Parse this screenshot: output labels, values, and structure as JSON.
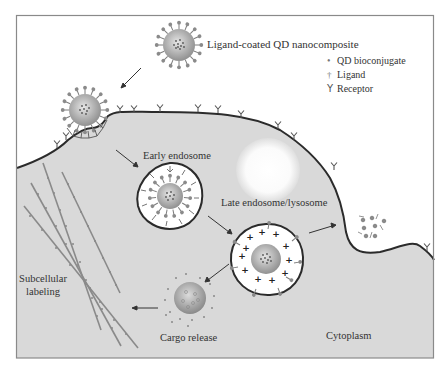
{
  "figure": {
    "type": "diagram",
    "colors": {
      "frame": "#8a8a8a",
      "cytoplasm": "#d9d9d9",
      "membrane": "#2b2b2b",
      "particle_core": "#a8a8a8",
      "ligand": "#7d7d7d",
      "arrow": "#333333"
    }
  },
  "labels": {
    "nanocomposite": "Ligand-coated QD nanocomposite",
    "early_endosome": "Early endosome",
    "late_endosome": "Late endosome/lysosome",
    "subcellular_line1": "Subcellular",
    "subcellular_line2": "labeling",
    "cargo_release": "Cargo release",
    "cytoplasm": "Cytoplasm"
  },
  "legend": {
    "items": [
      {
        "icon": "dot-icon",
        "symbol": "•",
        "label": "QD bioconjugate"
      },
      {
        "icon": "ligand-icon",
        "symbol": "ǂ",
        "label": "Ligand"
      },
      {
        "icon": "receptor-icon",
        "symbol": "Y",
        "label": "Receptor"
      }
    ]
  }
}
